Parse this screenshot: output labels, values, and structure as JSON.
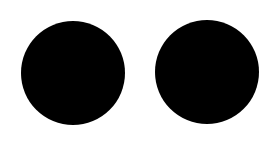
{
  "canvas": {
    "width": 274,
    "height": 144,
    "background": "#ffffff"
  },
  "shapes": [
    {
      "type": "circle",
      "name": "left-circle",
      "cx": 73,
      "cy": 73,
      "diameter": 104,
      "fill": "#000000"
    },
    {
      "type": "circle",
      "name": "right-circle",
      "cx": 207,
      "cy": 72,
      "diameter": 104,
      "fill": "#000000"
    }
  ]
}
